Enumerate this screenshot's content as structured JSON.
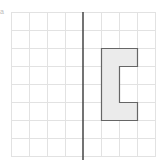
{
  "diagram": {
    "label": "a",
    "grid": {
      "origin_x": 11,
      "origin_y": 12,
      "cell_size": 18,
      "cols": 8,
      "rows": 8,
      "line_color": "#e2e2e2"
    },
    "mirror_line": {
      "x_cell": 4,
      "color": "#444444"
    },
    "shape": {
      "name": "C-shape (bracket)",
      "fill": "#ebebeb",
      "stroke": "#666666",
      "vertices_cells": [
        [
          5,
          2
        ],
        [
          7,
          2
        ],
        [
          7,
          3
        ],
        [
          6,
          3
        ],
        [
          6,
          5
        ],
        [
          7,
          5
        ],
        [
          7,
          6
        ],
        [
          5,
          6
        ]
      ]
    }
  }
}
